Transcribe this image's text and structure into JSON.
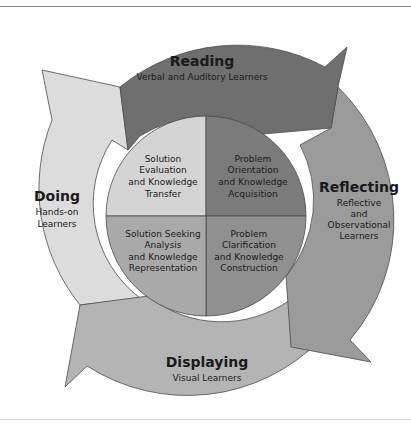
{
  "diagram": {
    "type": "cycle",
    "colors": {
      "reading": "#6f6f6f",
      "reflecting": "#9b9b9b",
      "displaying": "#b4b4b4",
      "doing": "#dcdcdc",
      "inner_top_left": "#d4d4d4",
      "inner_top_right": "#7b7b7b",
      "inner_bottom_left": "#a9a9a9",
      "inner_bottom_right": "#909090",
      "outline": "#4a4a4a",
      "text": "#1a1a1a"
    },
    "outer_stages": [
      {
        "id": "reading",
        "title": "Reading",
        "subtitle": [
          "Verbal and Auditory Learners"
        ]
      },
      {
        "id": "reflecting",
        "title": "Reflecting",
        "subtitle": [
          "Reflective",
          "and",
          "Observational",
          "Learners"
        ]
      },
      {
        "id": "displaying",
        "title": "Displaying",
        "subtitle": [
          "Visual Learners"
        ]
      },
      {
        "id": "doing",
        "title": "Doing",
        "subtitle": [
          "Hands-on",
          "Learners"
        ]
      }
    ],
    "inner_quadrants": [
      {
        "id": "top-left",
        "lines": [
          "Solution",
          "Evaluation",
          "and Knowledge",
          "Transfer"
        ]
      },
      {
        "id": "top-right",
        "lines": [
          "Problem",
          "Orientation",
          "and Knowledge",
          "Acquisition"
        ]
      },
      {
        "id": "bottom-left",
        "lines": [
          "Solution Seeking",
          "Analysis",
          "and Knowledge",
          "Representation"
        ]
      },
      {
        "id": "bottom-right",
        "lines": [
          "Problem",
          "Clarification",
          "and Knowledge",
          "Construction"
        ]
      }
    ]
  }
}
